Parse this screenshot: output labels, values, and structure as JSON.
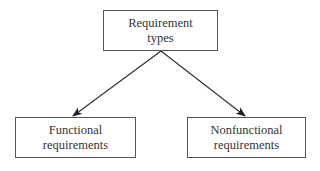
{
  "diagram": {
    "type": "tree",
    "root": {
      "id": "requirement-types",
      "lines": [
        "Requirement",
        "types"
      ]
    },
    "children": [
      {
        "id": "functional-requirements",
        "lines": [
          "Functional",
          "requirements"
        ]
      },
      {
        "id": "nonfunctional-requirements",
        "lines": [
          "Nonfunctional",
          "requirements"
        ]
      }
    ],
    "edges": [
      {
        "from": "requirement-types",
        "to": "functional-requirements",
        "style": "arrow"
      },
      {
        "from": "requirement-types",
        "to": "nonfunctional-requirements",
        "style": "arrow"
      }
    ],
    "colors": {
      "border": "#555555",
      "text": "#333333",
      "arrow": "#222222",
      "background": "#ffffff"
    }
  }
}
